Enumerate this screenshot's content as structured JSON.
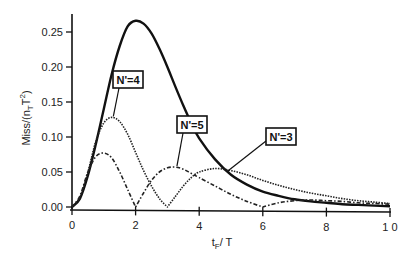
{
  "chart_data": {
    "type": "line",
    "title": "",
    "xlabel": "t_F / T",
    "xlabel_main": "t",
    "xlabel_sub": "F",
    "xlabel_rest": "/ T",
    "ylabel": "Miss/(n_T T^2)",
    "ylabel_main": "Miss/(n",
    "ylabel_sub": "T",
    "ylabel_mid": "T",
    "ylabel_sup": "2",
    "ylabel_end": ")",
    "xlim": [
      0,
      10
    ],
    "ylim": [
      0,
      0.27
    ],
    "x_ticks": [
      0,
      2,
      4,
      6,
      8,
      10
    ],
    "x_tick_labels": [
      "0",
      "2",
      "4",
      "6",
      "8",
      "1 0"
    ],
    "y_ticks": [
      0,
      0.05,
      0.1,
      0.15,
      0.2,
      0.25
    ],
    "y_tick_labels": [
      "0.00",
      "0.05",
      "0.10",
      "0.15",
      "0.20",
      "0.25"
    ],
    "grid": false,
    "series": [
      {
        "name": "N'=3",
        "style": "solid-thick",
        "x": [
          0,
          0.25,
          0.5,
          0.75,
          1.0,
          1.25,
          1.5,
          1.75,
          2.0,
          2.25,
          2.5,
          2.75,
          3.0,
          3.25,
          3.5,
          3.75,
          4.0,
          4.5,
          5.0,
          5.5,
          6.0,
          6.5,
          7.0,
          7.5,
          8.0,
          8.5,
          9.0,
          9.5,
          10.0
        ],
        "values": [
          0,
          0.012,
          0.045,
          0.09,
          0.14,
          0.19,
          0.23,
          0.258,
          0.266,
          0.262,
          0.248,
          0.226,
          0.2,
          0.172,
          0.145,
          0.12,
          0.098,
          0.068,
          0.046,
          0.032,
          0.022,
          0.016,
          0.011,
          0.008,
          0.006,
          0.004,
          0.003,
          0.002,
          0.001
        ]
      },
      {
        "name": "N'=4",
        "style": "dotted",
        "x": [
          0,
          0.25,
          0.5,
          0.75,
          1.0,
          1.25,
          1.5,
          1.75,
          2.0,
          2.25,
          2.5,
          2.75,
          3.0,
          3.25,
          3.5,
          3.75,
          4.0,
          4.5,
          5.0,
          5.5,
          6.0,
          6.5,
          7.0,
          7.5,
          8.0,
          8.5,
          9.0,
          9.5,
          10.0
        ],
        "values": [
          0,
          0.014,
          0.05,
          0.094,
          0.12,
          0.128,
          0.122,
          0.104,
          0.078,
          0.052,
          0.03,
          0.012,
          0,
          0.015,
          0.03,
          0.042,
          0.05,
          0.055,
          0.052,
          0.046,
          0.038,
          0.031,
          0.025,
          0.02,
          0.016,
          0.012,
          0.009,
          0.007,
          0.005
        ]
      },
      {
        "name": "N'=5",
        "style": "dash-dot",
        "x": [
          0,
          0.25,
          0.5,
          0.75,
          1.0,
          1.25,
          1.5,
          1.75,
          2.0,
          2.25,
          2.5,
          2.75,
          3.0,
          3.25,
          3.5,
          3.75,
          4.0,
          4.5,
          5.0,
          5.5,
          6.0,
          6.5,
          7.0,
          7.5,
          8.0,
          8.5,
          9.0,
          9.5,
          10.0
        ],
        "values": [
          0,
          0.016,
          0.05,
          0.072,
          0.077,
          0.07,
          0.05,
          0.025,
          0,
          0.02,
          0.038,
          0.05,
          0.056,
          0.057,
          0.054,
          0.048,
          0.042,
          0.03,
          0.018,
          0.008,
          0,
          0.006,
          0.009,
          0.01,
          0.009,
          0.008,
          0.006,
          0.005,
          0.004
        ]
      }
    ],
    "annotations": [
      {
        "text": "N'=4",
        "points_to_x": 1.3,
        "points_to_y": 0.128
      },
      {
        "text": "N'=5",
        "points_to_x": 3.3,
        "points_to_y": 0.057
      },
      {
        "text": "N'=3",
        "points_to_x": 4.9,
        "points_to_y": 0.05
      }
    ],
    "legend": "inline-boxed-annotations"
  }
}
